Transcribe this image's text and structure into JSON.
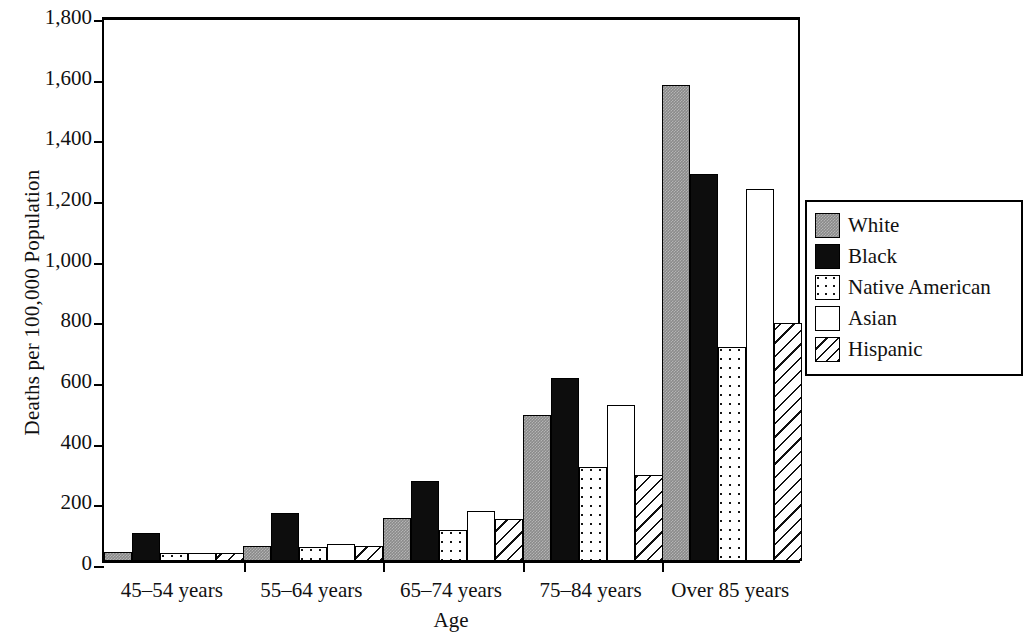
{
  "chart_data": {
    "type": "bar",
    "title": "",
    "xlabel": "Age",
    "ylabel": "Deaths per 100,000 Population",
    "categories": [
      "45–54 years",
      "55–64 years",
      "65–74 years",
      "75–84 years",
      "Over 85 years"
    ],
    "series": [
      {
        "name": "White",
        "values": [
          30,
          50,
          143,
          480,
          1570
        ]
      },
      {
        "name": "Black",
        "values": [
          92,
          157,
          263,
          602,
          1275
        ]
      },
      {
        "name": "Native American",
        "values": [
          25,
          45,
          103,
          310,
          705
        ]
      },
      {
        "name": "Asian",
        "values": [
          27,
          55,
          165,
          513,
          1225
        ]
      },
      {
        "name": "Hispanic",
        "values": [
          27,
          50,
          140,
          285,
          785
        ]
      }
    ],
    "ylim": [
      0,
      1800
    ],
    "yticks": [
      0,
      200,
      400,
      600,
      800,
      1000,
      1200,
      1400,
      1600,
      1800
    ],
    "ytick_labels": [
      "0",
      "200",
      "400",
      "600",
      "800",
      "1,000",
      "1,200",
      "1,400",
      "1,600",
      "1,800"
    ],
    "grid": false,
    "legend_position": "right"
  },
  "legend": {
    "items": [
      {
        "label": "White",
        "pattern": "gray-fill",
        "color": "#8a8a8a"
      },
      {
        "label": "Black",
        "pattern": "solid-black",
        "color": "#0d0d0d"
      },
      {
        "label": "Native American",
        "pattern": "dotted",
        "color": "#ffffff"
      },
      {
        "label": "Asian",
        "pattern": "plain-white",
        "color": "#ffffff"
      },
      {
        "label": "Hispanic",
        "pattern": "diagonal-hatch",
        "color": "#ffffff"
      }
    ]
  }
}
